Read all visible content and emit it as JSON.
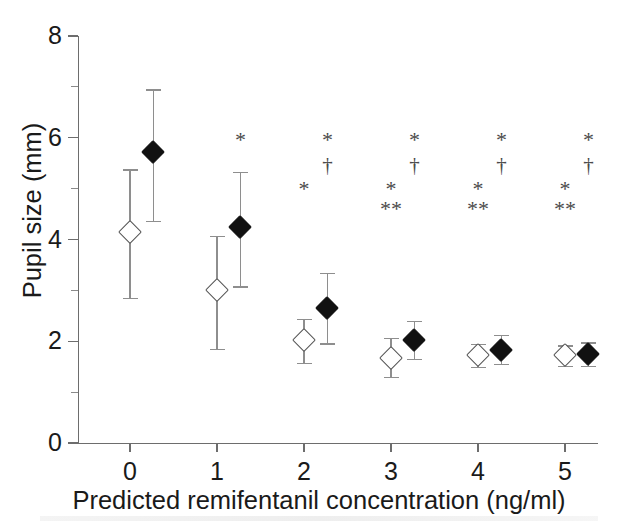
{
  "chart_data": {
    "type": "scatter",
    "title": "",
    "xlabel": "Predicted remifentanil concentration (ng/ml)",
    "ylabel": "Pupil size (mm)",
    "xlim": [
      -0.45,
      5.5
    ],
    "ylim": [
      0,
      8
    ],
    "x_ticks": [
      0,
      1,
      2,
      3,
      4,
      5
    ],
    "x_tick_labels": [
      "0",
      "1",
      "2",
      "3",
      "4",
      "5"
    ],
    "y_ticks": [
      0,
      2,
      4,
      6,
      8
    ],
    "y_tick_labels": [
      "0",
      "2",
      "4",
      "6",
      "8"
    ],
    "y_minor_ticks": [
      1,
      3,
      5,
      7
    ],
    "grid": false,
    "legend": null,
    "marker_offset": 0.27,
    "series": [
      {
        "name": "open-diamond",
        "marker": "open diamond",
        "x": [
          0,
          1,
          2,
          3,
          4,
          5
        ],
        "values": [
          4.15,
          3.0,
          2.02,
          1.68,
          1.72,
          1.72
        ],
        "err_low": [
          2.85,
          1.85,
          1.57,
          1.3,
          1.5,
          1.52
        ],
        "err_high": [
          5.38,
          4.07,
          2.44,
          2.06,
          1.95,
          1.92
        ]
      },
      {
        "name": "filled-diamond",
        "marker": "filled diamond",
        "x": [
          0,
          1,
          2,
          3,
          4,
          5
        ],
        "values": [
          5.72,
          4.25,
          2.65,
          2.02,
          1.82,
          1.74
        ],
        "err_low": [
          4.36,
          3.08,
          1.96,
          1.65,
          1.56,
          1.52
        ],
        "err_high": [
          6.95,
          5.33,
          3.34,
          2.4,
          2.12,
          1.98
        ]
      }
    ],
    "annotations": [
      {
        "symbol": "*",
        "x": 1.27,
        "y": 5.95
      },
      {
        "symbol": "*",
        "x": 2.27,
        "y": 5.95
      },
      {
        "symbol": "†",
        "x": 2.27,
        "y": 5.45
      },
      {
        "symbol": "*",
        "x": 3.27,
        "y": 5.95
      },
      {
        "symbol": "†",
        "x": 3.27,
        "y": 5.45
      },
      {
        "symbol": "*",
        "x": 4.27,
        "y": 5.95
      },
      {
        "symbol": "†",
        "x": 4.27,
        "y": 5.45
      },
      {
        "symbol": "*",
        "x": 5.27,
        "y": 5.95
      },
      {
        "symbol": "†",
        "x": 5.27,
        "y": 5.45
      },
      {
        "symbol": "*",
        "x": 2.0,
        "y": 5.0
      },
      {
        "symbol": "*",
        "x": 3.0,
        "y": 5.0
      },
      {
        "symbol": "**",
        "x": 3.0,
        "y": 4.6
      },
      {
        "symbol": "*",
        "x": 4.0,
        "y": 5.0
      },
      {
        "symbol": "**",
        "x": 4.0,
        "y": 4.6
      },
      {
        "symbol": "*",
        "x": 5.0,
        "y": 5.0
      },
      {
        "symbol": "**",
        "x": 5.0,
        "y": 4.6
      }
    ]
  },
  "axes": {
    "x_title": "Predicted remifentanil concentration (ng/ml)",
    "y_title": "Pupil size (mm)"
  }
}
